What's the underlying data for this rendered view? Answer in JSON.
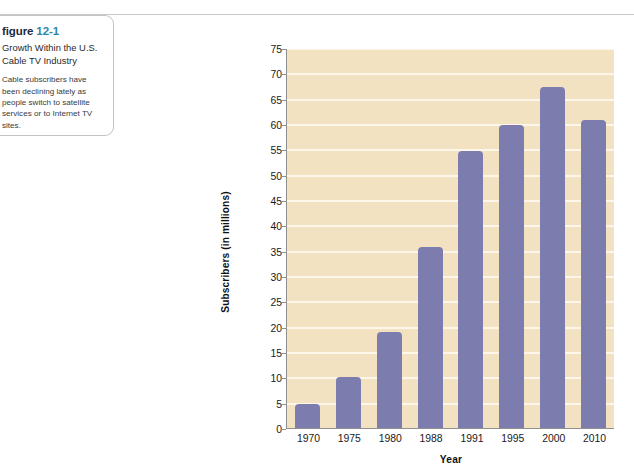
{
  "caption": {
    "heading_word": "figure",
    "heading_number": "12-1",
    "title": "Growth Within the U.S. Cable TV Industry",
    "description": "Cable subscribers have been declining lately as people switch to satellite services or to Internet TV sites."
  },
  "colors": {
    "figure_number": "#2f86a3",
    "figure_word": "#1d2a42",
    "plot_background": "#f3e2c2",
    "gridline": "#fdf6e9",
    "bar": "#7d7cae",
    "axis": "#8f8f8f",
    "page_rule": "#c9c9c9"
  },
  "chart_data": {
    "type": "bar",
    "title": "Growth Within the U.S. Cable TV Industry",
    "xlabel": "Year",
    "ylabel": "Subscribers (in millions)",
    "categories": [
      "1970",
      "1975",
      "1980",
      "1988",
      "1991",
      "1995",
      "2000",
      "2010"
    ],
    "values": [
      4.9,
      10.2,
      19.2,
      36.0,
      54.8,
      60.0,
      67.5,
      60.9
    ],
    "ylim": [
      0,
      75
    ],
    "ytick_step": 5,
    "yticks": [
      "0",
      "5",
      "10",
      "15",
      "20",
      "25",
      "30",
      "35",
      "40",
      "45",
      "50",
      "55",
      "60",
      "65",
      "70",
      "75"
    ],
    "grid": true,
    "grid_axis": "y",
    "legend": false,
    "legend_position": "none"
  }
}
